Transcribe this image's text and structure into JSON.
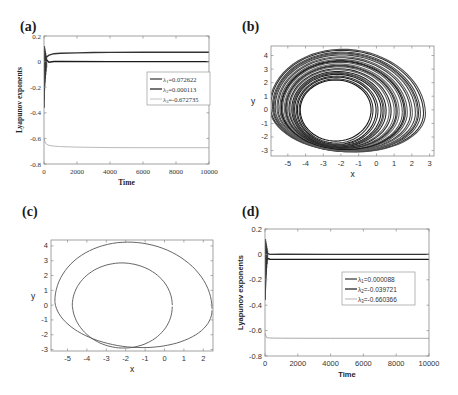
{
  "figure": {
    "panels": [
      {
        "id": "a",
        "label": "(a)"
      },
      {
        "id": "b",
        "label": "(b)"
      },
      {
        "id": "c",
        "label": "(c)"
      },
      {
        "id": "d",
        "label": "(d)"
      }
    ]
  },
  "chart_data": [
    {
      "panel": "(a)",
      "type": "line",
      "title": "",
      "xlabel": "Time",
      "ylabel": "Lyapunov exponents",
      "xlim": [
        0,
        10000
      ],
      "ylim": [
        -0.8,
        0.2
      ],
      "xticks": [
        "0",
        "2000",
        "4000",
        "6000",
        "8000",
        "10000"
      ],
      "yticks": [
        "0.2",
        "0",
        "-0.2",
        "-0.4",
        "-0.6",
        "-0.8"
      ],
      "grid": false,
      "legend_position": "right-middle",
      "series": [
        {
          "name": "λ1=0.072622",
          "color": "#333333",
          "x": [
            0,
            100,
            300,
            600,
            1000,
            2000,
            3000,
            4000,
            6000,
            8000,
            10000
          ],
          "values": [
            0.1,
            0.03,
            0.05,
            0.062,
            0.065,
            0.068,
            0.071,
            0.072,
            0.0725,
            0.0726,
            0.0726
          ]
        },
        {
          "name": "λ2=0.000113",
          "color": "#1a1a1a",
          "x": [
            0,
            100,
            300,
            600,
            1000,
            4000,
            10000
          ],
          "values": [
            -0.3,
            0.02,
            -0.005,
            0.001,
            0.0005,
            0.0002,
            0.0001
          ]
        },
        {
          "name": "λ3=-0.672735",
          "color": "#bbbbbb",
          "x": [
            0,
            100,
            300,
            600,
            1000,
            2000,
            4000,
            6000,
            8000,
            10000
          ],
          "values": [
            -0.6,
            -0.64,
            -0.655,
            -0.66,
            -0.664,
            -0.668,
            -0.672,
            -0.673,
            -0.673,
            -0.6727
          ]
        }
      ]
    },
    {
      "panel": "(b)",
      "type": "line",
      "title": "",
      "xlabel": "x",
      "ylabel": "y",
      "xlim": [
        -5.95,
        3.25
      ],
      "ylim": [
        -3.4,
        4.7
      ],
      "xticks": [
        "-5",
        "-4",
        "-3",
        "-2",
        "-1",
        "0",
        "1",
        "2",
        "3"
      ],
      "yticks": [
        "4",
        "3",
        "2",
        "1",
        "0",
        "-1",
        "-2",
        "-3"
      ],
      "grid": false,
      "description": "Chaotic attractor: densely wound phase portrait spanning x≈-5.7..3, y≈-3.2..4.5",
      "orbit_family": {
        "loops": 26,
        "inner": {
          "cx": -2.3,
          "rx": 2.0,
          "ry_top": 2.2,
          "ry_bot": 2.3
        },
        "outer": {
          "cx": -1.6,
          "rx": 4.4,
          "ry_top": 4.5,
          "ry_bot": 3.1
        }
      }
    },
    {
      "panel": "(c)",
      "type": "line",
      "title": "",
      "xlabel": "x",
      "ylabel": "y",
      "xlim": [
        -5.85,
        2.5
      ],
      "ylim": [
        -3.1,
        4.4
      ],
      "xticks": [
        "-5",
        "-4",
        "-3",
        "-2",
        "-1",
        "0",
        "1",
        "2"
      ],
      "yticks": [
        "4",
        "3",
        "2",
        "1",
        "0",
        "-1",
        "-2",
        "-3"
      ],
      "grid": false,
      "description": "Period-2 limit cycle: two nested closed loops",
      "loops": [
        {
          "name": "outer",
          "cx": -1.65,
          "rx_left": 4.0,
          "rx_right": 4.1,
          "top": 4.25,
          "bottom": -2.85
        },
        {
          "name": "inner",
          "cx": -2.2,
          "rx_left": 2.55,
          "rx_right": 2.6,
          "top": 2.85,
          "bottom": -2.9
        }
      ]
    },
    {
      "panel": "(d)",
      "type": "line",
      "title": "",
      "xlabel": "Time",
      "ylabel": "Lyapunov exponents",
      "xlim": [
        0,
        10000
      ],
      "ylim": [
        -0.8,
        0.2
      ],
      "xticks": [
        "0",
        "2000",
        "4000",
        "6000",
        "8000",
        "10000"
      ],
      "yticks": [
        "0.2",
        "0",
        "-0.2",
        "-0.4",
        "-0.6",
        "-0.8"
      ],
      "grid": false,
      "legend_position": "right-middle",
      "series": [
        {
          "name": "λ1=0.000088",
          "color": "#333333",
          "x": [
            0,
            100,
            300,
            1000,
            4000,
            10000
          ],
          "values": [
            0.1,
            0.01,
            0.0,
            0.0005,
            0.0001,
            0.0001
          ]
        },
        {
          "name": "λ2=-0.039721",
          "color": "#1a1a1a",
          "x": [
            0,
            100,
            300,
            1000,
            4000,
            10000
          ],
          "values": [
            -0.35,
            -0.03,
            -0.038,
            -0.039,
            -0.0397,
            -0.0397
          ]
        },
        {
          "name": "λ3=-0.660366",
          "color": "#aaaaaa",
          "x": [
            0,
            100,
            300,
            1000,
            4000,
            10000
          ],
          "values": [
            -0.62,
            -0.655,
            -0.658,
            -0.66,
            -0.6603,
            -0.6604
          ]
        }
      ]
    }
  ]
}
